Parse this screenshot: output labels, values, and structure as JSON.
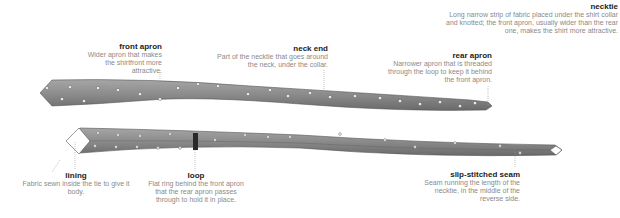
{
  "diagram": {
    "subject": "necktie",
    "colors": {
      "fabric": "#8c8c8c",
      "fabric_dark": "#6e6e6e",
      "dots": "#f2f2f2",
      "lining": "#ffffff",
      "loop": "#2a2a2a",
      "leader": "#9a9a9a",
      "title_text": "#222222",
      "body_text": "#8a8a8a"
    },
    "labels": {
      "necktie": {
        "title": "necktie",
        "text": "Long narrow strip of fabric placed under the shirt collar and knotted; the front apron, usually wider than the rear one, makes the shirt more attractive."
      },
      "front_apron": {
        "title": "front apron",
        "text": "Wider apron that makes the shirtfront more attractive."
      },
      "neck_end": {
        "title": "neck end",
        "text": "Part of the necktie that goes around the neck, under the collar."
      },
      "rear_apron": {
        "title": "rear apron",
        "text": "Narrower apron that is threaded through the loop to keep it behind the front apron."
      },
      "lining": {
        "title": "lining",
        "text": "Fabric sewn inside the tie to give it body."
      },
      "loop": {
        "title": "loop",
        "text": "Flat ring behind the front apron that the rear apron passes through to hold it in place."
      },
      "slip_stitched_seam": {
        "title": "slip-stitched seam",
        "text": "Seam running the length of the necktie, in the middle of the reverse side."
      }
    }
  }
}
